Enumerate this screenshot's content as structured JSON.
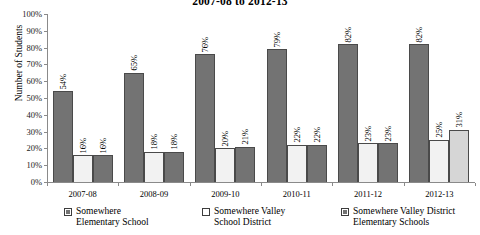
{
  "chart_data": {
    "type": "bar",
    "title": "2007-08 to 2012-13",
    "xlabel": "",
    "ylabel": "Number of Students",
    "ylim": [
      0,
      100
    ],
    "grid": false,
    "legend_position": "bottom",
    "categories": [
      "2007-08",
      "2008-09",
      "2009-10",
      "2010-11",
      "2011-12",
      "2012-13"
    ],
    "y_ticks": [
      "0%",
      "10%",
      "20%",
      "30%",
      "40%",
      "50%",
      "60%",
      "70%",
      "80%",
      "90%",
      "100%"
    ],
    "series": [
      {
        "name": "Somewhere Elementary School",
        "name_line1": "Somewhere",
        "name_line2": "Elementary School",
        "color": "#737373",
        "swatch": "filled",
        "values": [
          54,
          65,
          76,
          79,
          82,
          82
        ],
        "labels": [
          "54%",
          "65%",
          "76%",
          "79%",
          "82%",
          "82%"
        ]
      },
      {
        "name": "Somewhere Valley School District",
        "name_line1": "Somewhere Valley",
        "name_line2": "School District",
        "color": "#f2f2f2",
        "swatch": "hollow",
        "values": [
          16,
          18,
          20,
          22,
          23,
          25
        ],
        "labels": [
          "16%",
          "18%",
          "20%",
          "22%",
          "23%",
          "25%"
        ]
      },
      {
        "name": "Somewhere Valley District Elementary Schools",
        "name_line1": "Somewhere Valley District",
        "name_line2": "Elementary Schools",
        "color": "#737373",
        "swatch": "filled",
        "values": [
          16,
          18,
          21,
          22,
          23,
          31
        ],
        "labels": [
          "16%",
          "18%",
          "21%",
          "22%",
          "23%",
          "31%"
        ]
      }
    ]
  },
  "axis": {
    "y_title": "Number of Students"
  }
}
